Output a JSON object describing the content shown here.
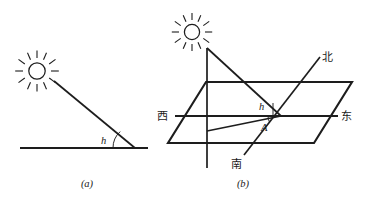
{
  "figure": {
    "background_color": "#ffffff",
    "ink_color": "#1d1d1d",
    "panels": [
      {
        "id": "panel-a",
        "caption": "(a)",
        "description": "Side view: sun ray meeting horizontal ground at altitude angle h",
        "labels": {
          "altitude_angle": "h"
        },
        "icons": {
          "sun": "sun-icon"
        }
      },
      {
        "id": "panel-b",
        "caption": "(b)",
        "description": "Perspective view: horizontal plane with cardinal directions, vertical gnomon, sun ray, altitude angle h and azimuth A",
        "labels": {
          "altitude_angle": "h",
          "azimuth_angle": "A",
          "direction_west": "西",
          "direction_east": "东",
          "direction_north": "北",
          "direction_south": "南"
        },
        "icons": {
          "sun": "sun-icon"
        }
      }
    ]
  }
}
